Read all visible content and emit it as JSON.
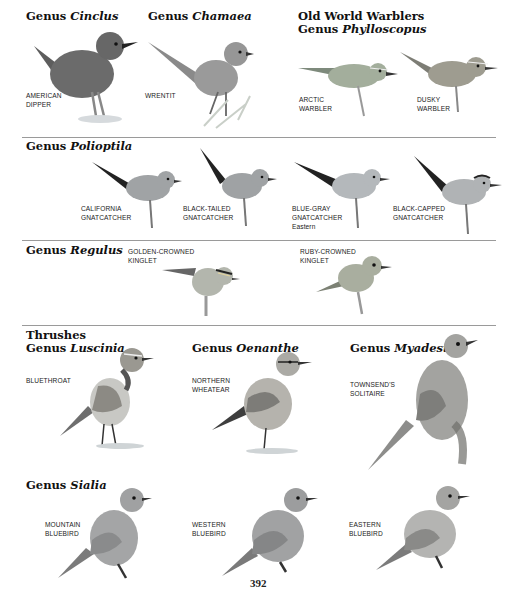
{
  "page": {
    "page_number": "392",
    "sections": [
      {
        "id": "cinclus",
        "heading": {
          "prefix": "Genus ",
          "genus": "Cinclus"
        },
        "species": [
          {
            "label": [
              "AMERICAN",
              "DIPPER"
            ]
          }
        ]
      },
      {
        "id": "chamaea",
        "heading": {
          "prefix": "Genus ",
          "genus": "Chamaea"
        },
        "species": [
          {
            "label": [
              "WRENTIT"
            ]
          }
        ]
      },
      {
        "id": "phylloscopus",
        "heading": {
          "group": "Old World Warblers",
          "prefix": "Genus ",
          "genus": "Phylloscopus"
        },
        "species": [
          {
            "label": [
              "ARCTIC",
              "WARBLER"
            ]
          },
          {
            "label": [
              "DUSKY",
              "WARBLER"
            ]
          }
        ]
      },
      {
        "id": "polioptila",
        "heading": {
          "prefix": "Genus ",
          "genus": "Polioptila"
        },
        "species": [
          {
            "label": [
              "CALIFORNIA",
              "GNATCATCHER"
            ]
          },
          {
            "label": [
              "BLACK-TAILED",
              "GNATCATCHER"
            ]
          },
          {
            "label": [
              "BLUE-GRAY",
              "GNATCATCHER"
            ],
            "subspecies": "Eastern"
          },
          {
            "label": [
              "BLACK-CAPPED",
              "GNATCATCHER"
            ]
          }
        ]
      },
      {
        "id": "regulus",
        "heading": {
          "prefix": "Genus ",
          "genus": "Regulus"
        },
        "species": [
          {
            "label": [
              "GOLDEN-CROWNED",
              "KINGLET"
            ]
          },
          {
            "label": [
              "RUBY-CROWNED",
              "KINGLET"
            ]
          }
        ]
      },
      {
        "id": "luscinia",
        "heading": {
          "group": "Thrushes",
          "prefix": "Genus ",
          "genus": "Luscinia"
        },
        "species": [
          {
            "label": [
              "BLUETHROAT"
            ]
          }
        ]
      },
      {
        "id": "oenanthe",
        "heading": {
          "prefix": "Genus ",
          "genus": "Oenanthe"
        },
        "species": [
          {
            "label": [
              "NORTHERN",
              "WHEATEAR"
            ]
          }
        ]
      },
      {
        "id": "myadestes",
        "heading": {
          "prefix": "Genus ",
          "genus": "Myadestes"
        },
        "species": [
          {
            "label": [
              "TOWNSEND'S",
              "SOLITAIRE"
            ]
          }
        ]
      },
      {
        "id": "sialia",
        "heading": {
          "prefix": "Genus ",
          "genus": "Sialia"
        },
        "species": [
          {
            "label": [
              "MOUNTAIN",
              "BLUEBIRD"
            ]
          },
          {
            "label": [
              "WESTERN",
              "BLUEBIRD"
            ]
          },
          {
            "label": [
              "EASTERN",
              "BLUEBIRD"
            ]
          }
        ]
      }
    ]
  }
}
